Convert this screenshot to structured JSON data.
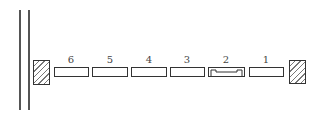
{
  "diagram": {
    "walls": {
      "left_lines": [
        19,
        28
      ]
    },
    "blocks": [
      {
        "label": "6",
        "x": 54,
        "w": 35,
        "type": "plain"
      },
      {
        "label": "5",
        "x": 92,
        "w": 36,
        "type": "plain"
      },
      {
        "label": "4",
        "x": 131,
        "w": 36,
        "type": "plain"
      },
      {
        "label": "3",
        "x": 170,
        "w": 35,
        "type": "plain"
      },
      {
        "label": "2",
        "x": 208,
        "w": 37,
        "type": "notched"
      },
      {
        "label": "1",
        "x": 249,
        "w": 35,
        "type": "plain"
      }
    ],
    "end_blocks": [
      "left-hatched-block",
      "right-hatched-block"
    ],
    "colors": {
      "line": "#333333",
      "background": "#ffffff"
    }
  }
}
